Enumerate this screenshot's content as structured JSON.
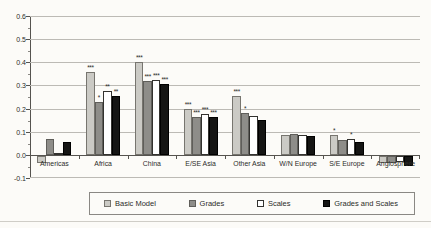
{
  "figure": {
    "background": "#fcfbf8"
  },
  "chart_data": {
    "type": "bar",
    "title": "",
    "xlabel": "",
    "ylabel": "",
    "grid": true,
    "legend_position": "bottom",
    "y_axis": {
      "min": -0.1,
      "max": 0.6,
      "step": 0.1,
      "tick_labels": [
        "0.6",
        "0.5",
        "0.4",
        "0.3",
        "0.2",
        "0.1",
        "0.0",
        "-0.1"
      ]
    },
    "categories": [
      "Americas",
      "Africa",
      "China",
      "E/SE Asia",
      "Other Asia",
      "W/N Europe",
      "S/E Europe",
      "Anglosphere"
    ],
    "series": [
      {
        "name": "Basic Model",
        "color": "#cbcac5",
        "border": "#77756f",
        "values": [
          -0.03,
          0.36,
          0.4,
          0.2,
          0.255,
          0.085,
          0.085,
          -0.03
        ],
        "stars": [
          "",
          "***",
          "***",
          "***",
          "***",
          "",
          "*",
          ""
        ]
      },
      {
        "name": "Grades",
        "color": "#8e8d89",
        "border": "#5f5e5a",
        "values": [
          0.07,
          0.23,
          0.32,
          0.165,
          0.18,
          0.09,
          0.065,
          -0.03
        ],
        "stars": [
          "",
          "*",
          "***",
          "***",
          "*",
          "",
          "",
          ""
        ]
      },
      {
        "name": "Scales",
        "color": "#ffffff",
        "border": "#33322f",
        "values": [
          0.01,
          0.275,
          0.325,
          0.175,
          0.17,
          0.085,
          0.07,
          -0.025
        ],
        "stars": [
          "",
          "**",
          "***",
          "***",
          "",
          "",
          "*",
          ""
        ]
      },
      {
        "name": "Grades and Scales",
        "color": "#151514",
        "border": "#000000",
        "values": [
          0.055,
          0.255,
          0.305,
          0.165,
          0.15,
          0.08,
          0.055,
          -0.045
        ],
        "stars": [
          "",
          "**",
          "***",
          "***",
          "",
          "",
          "",
          ""
        ]
      }
    ]
  }
}
